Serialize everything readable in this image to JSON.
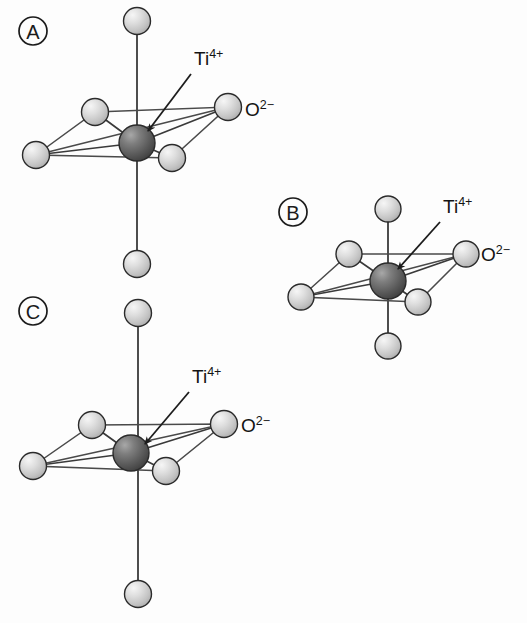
{
  "figure": {
    "background_color": "#fdfdfd",
    "ion_colors": {
      "titanium": "#5c5c5c",
      "titanium_highlight": "#9a9a9a",
      "oxygen": "#d0d0d0",
      "oxygen_highlight": "#f2f2f2",
      "outline": "#2b2b2b",
      "bond": "#3a3a3a"
    },
    "labels": {
      "cation_symbol": "Ti",
      "cation_charge": "4+",
      "anion_symbol": "O",
      "anion_charge": "2−"
    },
    "panels": [
      {
        "id": "A",
        "label": "A",
        "label_cx": 33,
        "label_cy": 31,
        "label_r": 14,
        "center": {
          "x": 137,
          "y": 143
        },
        "ti_radius": 18,
        "o_radius": 13.5,
        "axis_top": {
          "x": 137,
          "y": 21
        },
        "axis_bottom": {
          "x": 137,
          "y": 264
        },
        "equatorial": [
          {
            "name": "back-left",
            "x": 95,
            "y": 112
          },
          {
            "name": "back-right",
            "x": 228,
            "y": 107
          },
          {
            "name": "front-left",
            "x": 36,
            "y": 155
          },
          {
            "name": "front-right",
            "x": 172,
            "y": 158
          }
        ],
        "ti_label": {
          "x": 194,
          "y": 65
        },
        "ti_arrow_from": {
          "x": 191,
          "y": 74
        },
        "ti_arrow_to": {
          "x": 148,
          "y": 131
        },
        "o_label": {
          "x": 245,
          "y": 110
        }
      },
      {
        "id": "B",
        "label": "B",
        "label_cx": 293,
        "label_cy": 212,
        "label_r": 14,
        "center": {
          "x": 388,
          "y": 281
        },
        "ti_radius": 18,
        "o_radius": 13,
        "axis_top": {
          "x": 388,
          "y": 209
        },
        "axis_bottom": {
          "x": 388,
          "y": 346
        },
        "equatorial": [
          {
            "name": "back-left",
            "x": 349,
            "y": 254
          },
          {
            "name": "back-right",
            "x": 466,
            "y": 254
          },
          {
            "name": "front-left",
            "x": 301,
            "y": 297
          },
          {
            "name": "front-right",
            "x": 418,
            "y": 302
          }
        ],
        "ti_label": {
          "x": 443,
          "y": 213
        },
        "ti_arrow_from": {
          "x": 440,
          "y": 222
        },
        "ti_arrow_to": {
          "x": 398,
          "y": 269
        },
        "o_label": {
          "x": 481,
          "y": 255
        }
      },
      {
        "id": "C",
        "label": "C",
        "label_cx": 33,
        "label_cy": 311,
        "label_r": 14,
        "center": {
          "x": 131,
          "y": 453
        },
        "ti_radius": 18,
        "o_radius": 13.5,
        "axis_x": 138,
        "axis_top": {
          "x": 138,
          "y": 313
        },
        "axis_bottom": {
          "x": 138,
          "y": 594
        },
        "equatorial": [
          {
            "name": "back-left",
            "x": 92,
            "y": 425
          },
          {
            "name": "back-right",
            "x": 224,
            "y": 424
          },
          {
            "name": "front-left",
            "x": 33,
            "y": 466
          },
          {
            "name": "front-right",
            "x": 166,
            "y": 471
          }
        ],
        "ti_label": {
          "x": 192,
          "y": 383
        },
        "ti_arrow_from": {
          "x": 189,
          "y": 392
        },
        "ti_arrow_to": {
          "x": 145,
          "y": 444
        },
        "o_label": {
          "x": 241,
          "y": 426
        }
      }
    ]
  }
}
